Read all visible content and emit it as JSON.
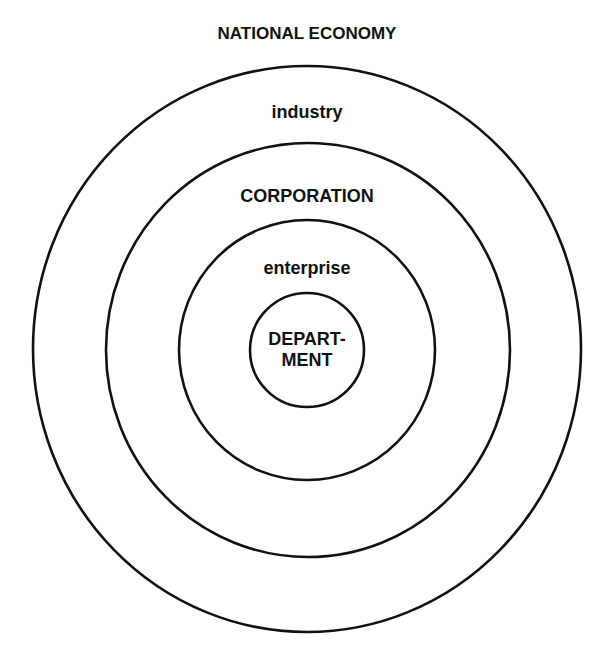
{
  "diagram": {
    "title": "NATIONAL ECONOMY",
    "rings": [
      {
        "label": "industry",
        "cx": 307,
        "cy": 349,
        "rx": 274,
        "ry": 283
      },
      {
        "label": "CORPORATION",
        "cx": 308,
        "cy": 350,
        "rx": 202,
        "ry": 207
      },
      {
        "label": "enterprise",
        "cx": 307,
        "cy": 350,
        "rx": 128,
        "ry": 130
      },
      {
        "label_line1": "DEPART-",
        "label_line2": "MENT",
        "cx": 307,
        "cy": 350,
        "rx": 57,
        "ry": 57
      }
    ],
    "stroke_color": "#111111",
    "background": "#ffffff"
  }
}
